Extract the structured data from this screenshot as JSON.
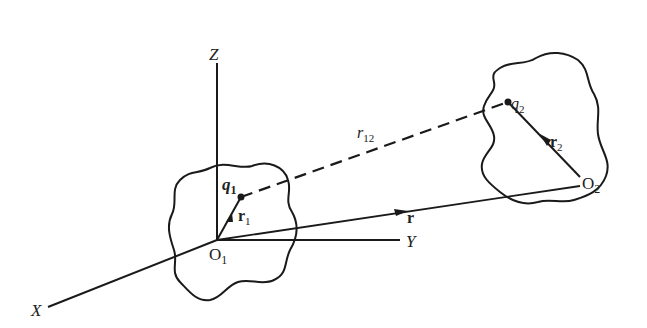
{
  "diagram": {
    "axes": {
      "x_label": "X",
      "y_label": "Y",
      "z_label": "Z"
    },
    "origins": {
      "o1": {
        "letter": "O",
        "sub": "1"
      },
      "o2": {
        "letter": "O",
        "sub": "2"
      }
    },
    "charges": {
      "q1": {
        "letter": "q",
        "sub": "1"
      },
      "q2": {
        "letter": "q",
        "sub": "2"
      }
    },
    "vectors": {
      "r1": {
        "letter": "r",
        "sub": "1"
      },
      "r2": {
        "letter": "r",
        "sub": "2"
      },
      "r": {
        "letter": "r"
      },
      "r12": {
        "letter": "r",
        "sub": "12"
      }
    },
    "colors": {
      "stroke": "#1a1a1a",
      "background": "#ffffff"
    }
  }
}
